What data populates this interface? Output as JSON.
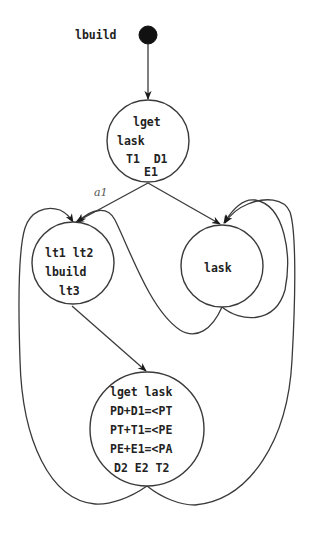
{
  "diagram": {
    "type": "state-transition-graph",
    "initial": {
      "label": "lbuild"
    },
    "nodes": [
      {
        "id": "s1",
        "lines": [
          "lget",
          "lask",
          "T1  D1",
          "E1"
        ]
      },
      {
        "id": "s2",
        "lines": [
          "lt1 lt2",
          "lbuild",
          "lt3"
        ]
      },
      {
        "id": "s3",
        "lines": [
          "lask"
        ]
      },
      {
        "id": "s4",
        "lines": [
          "lget lask",
          "PD+D1=<PT",
          "PT+T1=<PE",
          "PE+E1=<PA",
          "D2 E2 T2"
        ]
      }
    ],
    "edges": [
      {
        "from": "initial",
        "to": "s1",
        "label": ""
      },
      {
        "from": "s1",
        "to": "s2",
        "label": "a1"
      },
      {
        "from": "s1",
        "to": "s3",
        "label": ""
      },
      {
        "from": "s2",
        "to": "s4",
        "label": ""
      },
      {
        "from": "s3",
        "to": "s2",
        "label": ""
      },
      {
        "from": "s3",
        "to": "s3",
        "label": ""
      },
      {
        "from": "s4",
        "to": "s2",
        "label": ""
      },
      {
        "from": "s4",
        "to": "s3",
        "label": ""
      }
    ],
    "colors": {
      "stroke": "#3a3a3a",
      "text": "#222222",
      "initial_fill": "#111111",
      "background": "#ffffff"
    }
  }
}
